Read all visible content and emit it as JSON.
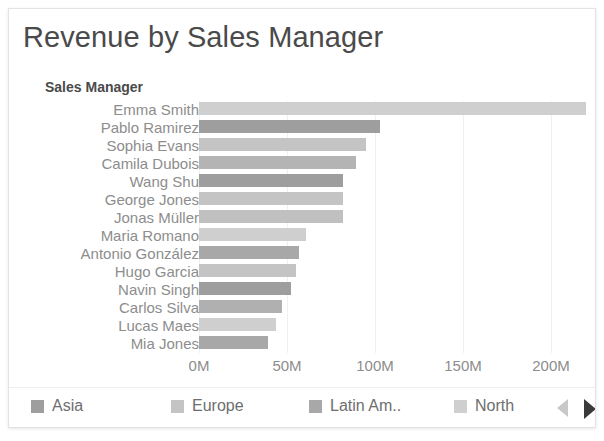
{
  "title": "Revenue by Sales Manager",
  "axis_caption": "Sales Manager",
  "legend": {
    "items": [
      {
        "label": "Asia",
        "color": "#9e9e9e",
        "x": 22
      },
      {
        "label": "Europe",
        "color": "#c4c4c4",
        "x": 162
      },
      {
        "label": "Latin Am..",
        "color": "#a8a8a8",
        "x": 300
      },
      {
        "label": "North",
        "color": "#cfcfcf",
        "x": 445
      }
    ],
    "prev_icon": "triangle-left-icon",
    "next_icon": "triangle-right-icon"
  },
  "chart_data": {
    "type": "bar",
    "orientation": "horizontal",
    "title": "Revenue by Sales Manager",
    "xlabel": "",
    "ylabel": "Sales Manager",
    "xlim": [
      0,
      220
    ],
    "grid": true,
    "legend_position": "bottom",
    "tick_labels": [
      "0M",
      "50M",
      "100M",
      "150M",
      "200M"
    ],
    "tick_values": [
      0,
      50,
      100,
      150,
      200
    ],
    "categories": [
      "Emma Smith",
      "Pablo Ramirez",
      "Sophia Evans",
      "Camila Dubois",
      "Wang Shu",
      "George Jones",
      "Jonas Müller",
      "Maria Romano",
      "Antonio González",
      "Hugo Garcia",
      "Navin Singh",
      "Carlos Silva",
      "Lucas Maes",
      "Mia Jones"
    ],
    "values": [
      220,
      103,
      95,
      89,
      82,
      82,
      82,
      61,
      57,
      55,
      52,
      47,
      44,
      39
    ],
    "colors": [
      "#cfcfcf",
      "#9e9e9e",
      "#c4c4c4",
      "#b4b4b4",
      "#9e9e9e",
      "#c4c4c4",
      "#c0c0c0",
      "#cfcfcf",
      "#a8a8a8",
      "#c4c4c4",
      "#9e9e9e",
      "#b0b0b0",
      "#cfcfcf",
      "#a8a8a8"
    ],
    "regions": [
      "North",
      "Asia",
      "Europe",
      "Europe",
      "Asia",
      "Europe",
      "Europe",
      "North",
      "Latin Am..",
      "Europe",
      "Asia",
      "Latin Am..",
      "North",
      "Latin Am.."
    ]
  }
}
